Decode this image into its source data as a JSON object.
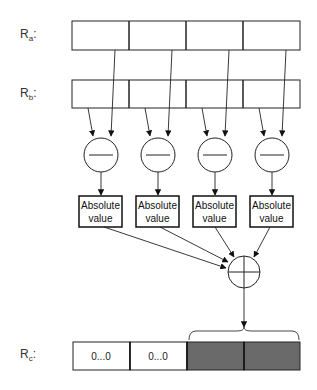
{
  "registers": {
    "ra": {
      "name": "R",
      "sub": "a",
      "suffix": ":"
    },
    "rb": {
      "name": "R",
      "sub": "b",
      "suffix": ":"
    },
    "rc": {
      "name": "R",
      "sub": "c",
      "suffix": ":",
      "cells": [
        "0...0",
        "0...0",
        "",
        ""
      ]
    }
  },
  "operations": {
    "subtract_symbol": "minus",
    "abs_label_line1": "Absolute",
    "abs_label_line2": "value",
    "adder_symbol": "plus"
  },
  "colors": {
    "stroke": "#222222",
    "result_fill": "#6a6a6a",
    "background": "#ffffff"
  }
}
